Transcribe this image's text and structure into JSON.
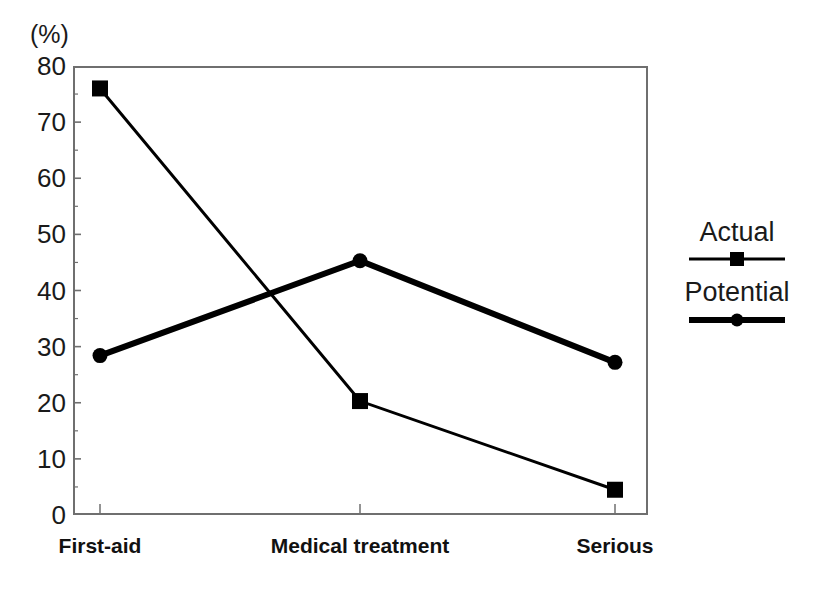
{
  "chart_data": {
    "type": "line",
    "title": "",
    "subtitle": "",
    "xlabel": "",
    "ylabel": "(%)",
    "unit_label": "(%)",
    "categories": [
      "First-aid",
      "Medical treatment",
      "Serious"
    ],
    "series": [
      {
        "name": "Actual",
        "values": [
          76,
          20.3,
          4.5
        ],
        "marker": "square",
        "line_width_px": 3,
        "color": "#000000"
      },
      {
        "name": "Potential",
        "values": [
          28.4,
          45.3,
          27.2
        ],
        "marker": "circle",
        "line_width_px": 6,
        "color": "#000000"
      }
    ],
    "ylim": [
      0,
      80
    ],
    "y_major_ticks": [
      0,
      10,
      20,
      30,
      40,
      50,
      60,
      70,
      80
    ],
    "y_minor_ticks": [
      5,
      15,
      25,
      35,
      45,
      55,
      65,
      75
    ],
    "y_tick_labels": [
      "0",
      "10",
      "20",
      "30",
      "40",
      "50",
      "60",
      "70",
      "80"
    ],
    "grid": false,
    "legend_position": "right",
    "legend_entries": [
      "Actual",
      "Potential"
    ],
    "frame": true,
    "background": "#ffffff",
    "axis_color": "#6f6f6f"
  },
  "axis": {
    "unit": "(%)"
  }
}
